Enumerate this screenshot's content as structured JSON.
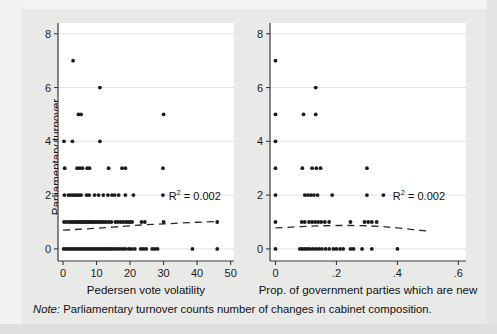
{
  "figure": {
    "note_prefix": "Note:",
    "note_text": " Parliamentary turnover counts number of changes in cabinet composition.",
    "background_color": "#e9e9e7",
    "plot_background_color": "#ffffff",
    "point_color": "#1b1b1b",
    "fitline_color": "#2a2a2a",
    "ylabel": "Parliamentary turnover"
  },
  "chart_data": [
    {
      "type": "scatter",
      "panel": "left",
      "title": "",
      "xlabel": "Pedersen vote volatility",
      "ylabel": "Parliamentary turnover",
      "xlim": [
        -1.5,
        51
      ],
      "ylim": [
        -0.45,
        8.4
      ],
      "xticks": [
        0,
        10,
        20,
        30,
        40,
        50
      ],
      "xticklabels": [
        "0",
        "10",
        "20",
        "30",
        "40",
        "50"
      ],
      "yticks": [
        0,
        2,
        4,
        6,
        8
      ],
      "yticklabels": [
        "0",
        "2",
        "4",
        "6",
        "8"
      ],
      "grid": "horizontal",
      "annotation": "R2 = 0.002",
      "annotation_r2_value": 0.002,
      "legend": "none",
      "fitline_style": "dashed",
      "fitline_points": [
        [
          0.0,
          0.7
        ],
        [
          5.0,
          0.73
        ],
        [
          10.0,
          0.77
        ],
        [
          15.0,
          0.81
        ],
        [
          20.0,
          0.86
        ],
        [
          25.0,
          0.9
        ],
        [
          30.0,
          0.93
        ],
        [
          35.0,
          0.96
        ],
        [
          40.0,
          0.99
        ],
        [
          46.0,
          1.02
        ]
      ],
      "points": [
        [
          3.0,
          7
        ],
        [
          11.0,
          6
        ],
        [
          4.6,
          5
        ],
        [
          5.4,
          5
        ],
        [
          30.0,
          5
        ],
        [
          0.3,
          4
        ],
        [
          2.8,
          4
        ],
        [
          11.0,
          4
        ],
        [
          0.5,
          3
        ],
        [
          4.2,
          3
        ],
        [
          5.0,
          3
        ],
        [
          5.8,
          3
        ],
        [
          7.2,
          3
        ],
        [
          7.9,
          3
        ],
        [
          13.6,
          3
        ],
        [
          17.6,
          3
        ],
        [
          18.6,
          3
        ],
        [
          29.8,
          3
        ],
        [
          0.4,
          2
        ],
        [
          1.6,
          2
        ],
        [
          2.3,
          2
        ],
        [
          3.0,
          2
        ],
        [
          3.6,
          2
        ],
        [
          4.2,
          2
        ],
        [
          4.8,
          2
        ],
        [
          5.4,
          2
        ],
        [
          7.0,
          2
        ],
        [
          7.8,
          2
        ],
        [
          9.4,
          2
        ],
        [
          10.6,
          2
        ],
        [
          12.0,
          2
        ],
        [
          13.4,
          2
        ],
        [
          14.6,
          2
        ],
        [
          15.4,
          2
        ],
        [
          16.6,
          2
        ],
        [
          18.6,
          2
        ],
        [
          21.0,
          2
        ],
        [
          29.8,
          2
        ],
        [
          0.3,
          1
        ],
        [
          1.0,
          1
        ],
        [
          1.8,
          1
        ],
        [
          2.4,
          1
        ],
        [
          3.0,
          1
        ],
        [
          3.6,
          1
        ],
        [
          4.1,
          1
        ],
        [
          4.6,
          1
        ],
        [
          5.1,
          1
        ],
        [
          5.6,
          1
        ],
        [
          6.1,
          1
        ],
        [
          6.6,
          1
        ],
        [
          7.1,
          1
        ],
        [
          7.6,
          1
        ],
        [
          8.1,
          1
        ],
        [
          8.6,
          1
        ],
        [
          9.2,
          1
        ],
        [
          9.8,
          1
        ],
        [
          10.4,
          1
        ],
        [
          11.0,
          1
        ],
        [
          11.6,
          1
        ],
        [
          12.2,
          1
        ],
        [
          12.8,
          1
        ],
        [
          13.6,
          1
        ],
        [
          14.4,
          1
        ],
        [
          15.6,
          1
        ],
        [
          16.4,
          1
        ],
        [
          17.2,
          1
        ],
        [
          18.0,
          1
        ],
        [
          18.8,
          1
        ],
        [
          19.4,
          1
        ],
        [
          20.0,
          1
        ],
        [
          20.6,
          1
        ],
        [
          23.4,
          1
        ],
        [
          24.4,
          1
        ],
        [
          30.0,
          1
        ],
        [
          46.0,
          1
        ],
        [
          0.2,
          0
        ],
        [
          0.9,
          0
        ],
        [
          1.5,
          0
        ],
        [
          2.1,
          0
        ],
        [
          2.7,
          0
        ],
        [
          3.3,
          0
        ],
        [
          3.9,
          0
        ],
        [
          4.5,
          0
        ],
        [
          5.1,
          0
        ],
        [
          5.7,
          0
        ],
        [
          6.3,
          0
        ],
        [
          6.9,
          0
        ],
        [
          7.5,
          0
        ],
        [
          8.1,
          0
        ],
        [
          8.7,
          0
        ],
        [
          9.3,
          0
        ],
        [
          9.9,
          0
        ],
        [
          10.5,
          0
        ],
        [
          11.1,
          0
        ],
        [
          11.7,
          0
        ],
        [
          12.3,
          0
        ],
        [
          12.9,
          0
        ],
        [
          13.5,
          0
        ],
        [
          14.1,
          0
        ],
        [
          14.8,
          0
        ],
        [
          15.5,
          0
        ],
        [
          16.2,
          0
        ],
        [
          17.0,
          0
        ],
        [
          17.8,
          0
        ],
        [
          18.6,
          0
        ],
        [
          19.6,
          0
        ],
        [
          20.4,
          0
        ],
        [
          21.4,
          0
        ],
        [
          23.2,
          0
        ],
        [
          24.0,
          0
        ],
        [
          24.8,
          0
        ],
        [
          26.6,
          0
        ],
        [
          27.4,
          0
        ],
        [
          28.2,
          0
        ],
        [
          38.6,
          0
        ],
        [
          46.0,
          0
        ]
      ]
    },
    {
      "type": "scatter",
      "panel": "right",
      "title": "",
      "xlabel": "Prop. of government parties which are new",
      "ylabel": "Parliamentary turnover",
      "xlim": [
        -0.018,
        0.625
      ],
      "ylim": [
        -0.45,
        8.4
      ],
      "xticks": [
        0,
        0.2,
        0.4,
        0.6
      ],
      "xticklabels": [
        "0",
        ".2",
        ".4",
        ".6"
      ],
      "yticks": [
        0,
        2,
        4,
        6,
        8
      ],
      "yticklabels": [
        "0",
        "2",
        "4",
        "6",
        "8"
      ],
      "grid": "horizontal",
      "annotation": "R2 = 0.002",
      "annotation_r2_value": 0.002,
      "legend": "none",
      "fitline_style": "dashed",
      "fitline_points": [
        [
          0.0,
          0.78
        ],
        [
          0.05,
          0.81
        ],
        [
          0.1,
          0.84
        ],
        [
          0.15,
          0.86
        ],
        [
          0.2,
          0.87
        ],
        [
          0.25,
          0.87
        ],
        [
          0.3,
          0.86
        ],
        [
          0.35,
          0.83
        ],
        [
          0.4,
          0.78
        ],
        [
          0.45,
          0.72
        ],
        [
          0.5,
          0.66
        ]
      ],
      "points": [
        [
          0.0,
          7
        ],
        [
          0.132,
          6
        ],
        [
          0.0,
          5
        ],
        [
          0.092,
          5
        ],
        [
          0.132,
          5
        ],
        [
          0.0,
          4
        ],
        [
          0.0,
          3
        ],
        [
          0.088,
          3
        ],
        [
          0.12,
          3
        ],
        [
          0.134,
          3
        ],
        [
          0.148,
          3
        ],
        [
          0.3,
          3
        ],
        [
          0.0,
          2
        ],
        [
          0.096,
          2
        ],
        [
          0.106,
          2
        ],
        [
          0.116,
          2
        ],
        [
          0.126,
          2
        ],
        [
          0.138,
          2
        ],
        [
          0.186,
          2
        ],
        [
          0.3,
          2
        ],
        [
          0.354,
          2
        ],
        [
          0.0,
          1
        ],
        [
          0.086,
          1
        ],
        [
          0.096,
          1
        ],
        [
          0.11,
          1
        ],
        [
          0.12,
          1
        ],
        [
          0.13,
          1
        ],
        [
          0.14,
          1
        ],
        [
          0.15,
          1
        ],
        [
          0.162,
          1
        ],
        [
          0.176,
          1
        ],
        [
          0.246,
          1
        ],
        [
          0.292,
          1
        ],
        [
          0.304,
          1
        ],
        [
          0.316,
          1
        ],
        [
          0.332,
          1
        ],
        [
          0.0,
          0
        ],
        [
          0.08,
          0
        ],
        [
          0.088,
          0
        ],
        [
          0.096,
          0
        ],
        [
          0.104,
          0
        ],
        [
          0.112,
          0
        ],
        [
          0.122,
          0
        ],
        [
          0.132,
          0
        ],
        [
          0.142,
          0
        ],
        [
          0.152,
          0
        ],
        [
          0.164,
          0
        ],
        [
          0.176,
          0
        ],
        [
          0.19,
          0
        ],
        [
          0.2,
          0
        ],
        [
          0.212,
          0
        ],
        [
          0.222,
          0
        ],
        [
          0.246,
          0
        ],
        [
          0.256,
          0
        ],
        [
          0.284,
          0
        ],
        [
          0.316,
          0
        ],
        [
          0.4,
          0
        ]
      ]
    }
  ]
}
